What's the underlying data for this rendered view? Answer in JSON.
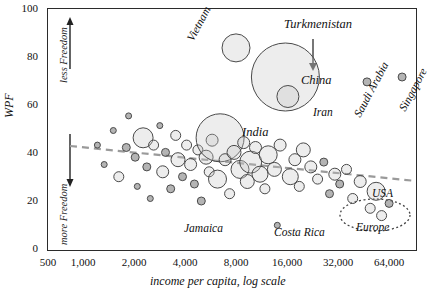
{
  "chart_data": {
    "type": "scatter",
    "title": "",
    "xlabel": "income per capita, log scale",
    "ylabel": "WPF",
    "xscale": "log",
    "xlim": [
      500,
      90000
    ],
    "ylim": [
      0,
      100
    ],
    "yticks": [
      0,
      20,
      40,
      60,
      80,
      100
    ],
    "xticks": [
      "500",
      "1,000",
      "2,000",
      "4,000",
      "8,000",
      "16,000",
      "32,000",
      "64,000"
    ],
    "xtick_values": [
      500,
      1000,
      2000,
      4000,
      8000,
      16000,
      32000,
      64000
    ],
    "grid": false,
    "legend": "none",
    "axis_annotations": [
      {
        "text": "less Freedom",
        "position": "upper-left-vertical"
      },
      {
        "text": "more Freedom",
        "position": "lower-left-vertical"
      }
    ],
    "trendline": {
      "style": "dashed",
      "color": "#9a9a9a",
      "from": [
        800,
        44
      ],
      "to": [
        80000,
        30
      ]
    },
    "annotations": [
      {
        "label": "Turkmenistan",
        "x": 16000,
        "y": 95,
        "points_to": [
          14000,
          78
        ]
      },
      {
        "label": "Vietnam",
        "x": 7000,
        "y": 84,
        "bubble": true
      },
      {
        "label": "China",
        "x": 14000,
        "y": 72,
        "bubble": true,
        "size": "largest"
      },
      {
        "label": "Iran",
        "x": 14500,
        "y": 64,
        "bubble": true
      },
      {
        "label": "India",
        "x": 5600,
        "y": 47,
        "bubble": true,
        "size": "large"
      },
      {
        "label": "Saudi Arabia",
        "x": 44000,
        "y": 70,
        "rotated": true
      },
      {
        "label": "Singapore",
        "x": 72000,
        "y": 72,
        "rotated": true
      },
      {
        "label": "USA",
        "x": 50000,
        "y": 25,
        "bubble": true
      },
      {
        "label": "Europe",
        "x": 44000,
        "y": 12,
        "group": true
      },
      {
        "label": "Jamaica",
        "x": 5200,
        "y": 13
      },
      {
        "label": "Costa Rica",
        "x": 12500,
        "y": 11
      }
    ],
    "bubbles": [
      {
        "x": 1000,
        "y": 44,
        "r": 3
      },
      {
        "x": 1100,
        "y": 36,
        "r": 3
      },
      {
        "x": 1250,
        "y": 50,
        "r": 3
      },
      {
        "x": 1350,
        "y": 31,
        "r": 5
      },
      {
        "x": 1500,
        "y": 43,
        "r": 4
      },
      {
        "x": 1550,
        "y": 56,
        "r": 3
      },
      {
        "x": 1700,
        "y": 39,
        "r": 4
      },
      {
        "x": 1750,
        "y": 27,
        "r": 3
      },
      {
        "x": 1900,
        "y": 47,
        "r": 10
      },
      {
        "x": 2000,
        "y": 35,
        "r": 4
      },
      {
        "x": 2100,
        "y": 22,
        "r": 3
      },
      {
        "x": 2200,
        "y": 44,
        "r": 5
      },
      {
        "x": 2400,
        "y": 52,
        "r": 3
      },
      {
        "x": 2500,
        "y": 33,
        "r": 6
      },
      {
        "x": 2600,
        "y": 41,
        "r": 4
      },
      {
        "x": 2800,
        "y": 26,
        "r": 4
      },
      {
        "x": 3000,
        "y": 48,
        "r": 5
      },
      {
        "x": 3100,
        "y": 38,
        "r": 7
      },
      {
        "x": 3300,
        "y": 31,
        "r": 4
      },
      {
        "x": 3500,
        "y": 44,
        "r": 5
      },
      {
        "x": 3700,
        "y": 36,
        "r": 6
      },
      {
        "x": 3900,
        "y": 28,
        "r": 4
      },
      {
        "x": 4100,
        "y": 42,
        "r": 5
      },
      {
        "x": 4300,
        "y": 21,
        "r": 4
      },
      {
        "x": 4600,
        "y": 39,
        "r": 7
      },
      {
        "x": 4800,
        "y": 33,
        "r": 5
      },
      {
        "x": 5000,
        "y": 46,
        "r": 6
      },
      {
        "x": 5400,
        "y": 30,
        "r": 9
      },
      {
        "x": 5600,
        "y": 47,
        "r": 24
      },
      {
        "x": 6000,
        "y": 38,
        "r": 6
      },
      {
        "x": 6400,
        "y": 24,
        "r": 5
      },
      {
        "x": 6800,
        "y": 41,
        "r": 7
      },
      {
        "x": 7000,
        "y": 84,
        "r": 14
      },
      {
        "x": 7400,
        "y": 34,
        "r": 9
      },
      {
        "x": 7800,
        "y": 45,
        "r": 6
      },
      {
        "x": 8200,
        "y": 29,
        "r": 7
      },
      {
        "x": 8600,
        "y": 37,
        "r": 11
      },
      {
        "x": 9200,
        "y": 43,
        "r": 6
      },
      {
        "x": 9800,
        "y": 32,
        "r": 8
      },
      {
        "x": 10500,
        "y": 26,
        "r": 5
      },
      {
        "x": 11000,
        "y": 40,
        "r": 9
      },
      {
        "x": 12000,
        "y": 34,
        "r": 7
      },
      {
        "x": 12500,
        "y": 11,
        "r": 3
      },
      {
        "x": 13000,
        "y": 44,
        "r": 6
      },
      {
        "x": 14000,
        "y": 72,
        "r": 34
      },
      {
        "x": 14500,
        "y": 64,
        "r": 11
      },
      {
        "x": 15000,
        "y": 31,
        "r": 8
      },
      {
        "x": 16000,
        "y": 38,
        "r": 6
      },
      {
        "x": 17000,
        "y": 27,
        "r": 5
      },
      {
        "x": 18000,
        "y": 42,
        "r": 7
      },
      {
        "x": 20000,
        "y": 35,
        "r": 6
      },
      {
        "x": 22000,
        "y": 30,
        "r": 5
      },
      {
        "x": 24000,
        "y": 37,
        "r": 4
      },
      {
        "x": 26000,
        "y": 24,
        "r": 4
      },
      {
        "x": 28000,
        "y": 32,
        "r": 6
      },
      {
        "x": 30000,
        "y": 28,
        "r": 4
      },
      {
        "x": 33000,
        "y": 34,
        "r": 5
      },
      {
        "x": 36000,
        "y": 22,
        "r": 5
      },
      {
        "x": 40000,
        "y": 29,
        "r": 6
      },
      {
        "x": 44000,
        "y": 70,
        "r": 4
      },
      {
        "x": 46000,
        "y": 18,
        "r": 5
      },
      {
        "x": 50000,
        "y": 25,
        "r": 9
      },
      {
        "x": 54000,
        "y": 15,
        "r": 5
      },
      {
        "x": 60000,
        "y": 20,
        "r": 4
      },
      {
        "x": 72000,
        "y": 72,
        "r": 4
      }
    ]
  },
  "axis": {
    "y_title": "WPF",
    "x_title": "income per capita, log scale",
    "note_top": "less Freedom",
    "note_bottom": "more Freedom"
  },
  "labels": {
    "turkmenistan": "Turkmenistan",
    "vietnam": "Vietnam",
    "china": "China",
    "iran": "Iran",
    "india": "India",
    "saudi_arabia": "Saudi Arabia",
    "singapore": "Singapore",
    "usa": "USA",
    "europe": "Europe",
    "jamaica": "Jamaica",
    "costa_rica": "Costa Rica"
  },
  "ticks": {
    "y": [
      "100",
      "80",
      "60",
      "40",
      "20",
      "0"
    ],
    "x": [
      "500",
      "1,000",
      "2,000",
      "4,000",
      "8,000",
      "16,000",
      "32,000",
      "64,000"
    ]
  }
}
